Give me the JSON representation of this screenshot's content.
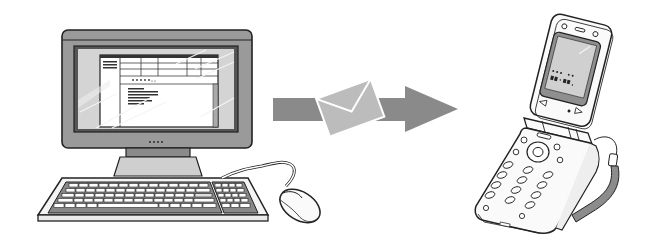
{
  "figure": {
    "elements": {
      "computer": {
        "label": "desktop-computer",
        "screen_window_title": "・・・・・・"
      },
      "message": {
        "label": "email-envelope"
      },
      "arrow": {
        "label": "transfer-arrow",
        "direction": "right"
      },
      "phone": {
        "label": "flip-mobile-phone",
        "screen_text_line1": "・・・ ・・",
        "screen_text_line2": "・・:・・."
      }
    },
    "colors": {
      "line": "#222222",
      "monitor_frame": "#9a9a9a",
      "screen_glass": "#cfcfcf",
      "arrow": "#8a8a8a",
      "envelope": "#b8b8b8",
      "phone_screen": "#c4c4c4",
      "strap": "#8c8c8c",
      "background": "#ffffff"
    }
  }
}
